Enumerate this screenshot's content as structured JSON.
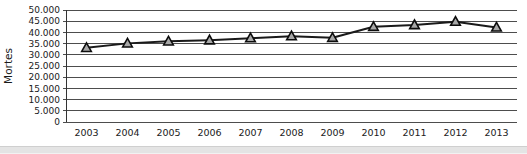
{
  "chart_data": {
    "type": "line",
    "title": "",
    "xlabel": "",
    "ylabel": "Mortes",
    "categories": [
      "2003",
      "2004",
      "2005",
      "2006",
      "2007",
      "2008",
      "2009",
      "2010",
      "2011",
      "2012",
      "2013"
    ],
    "values": [
      33100,
      35100,
      36000,
      36500,
      37400,
      38300,
      37600,
      42500,
      43300,
      44800,
      42200
    ],
    "ylim": [
      0,
      50000
    ],
    "y_tick_step": 5000,
    "y_ticks": [
      "0",
      "5.000",
      "10.000",
      "15.000",
      "20.000",
      "25.000",
      "30.000",
      "35.000",
      "40.000",
      "45.000",
      "50.000"
    ],
    "grid": true,
    "legend": false,
    "marker": "triangle-up"
  },
  "colors": {
    "line": "#1a1a1a",
    "marker_fill": "#a8a8a8",
    "marker_stroke": "#0d0d0d",
    "grid": "#4d4d4d",
    "axis": "#333333",
    "text": "#1a1a1a",
    "background": "#ffffff",
    "page_edge": "#e4e4e4"
  }
}
